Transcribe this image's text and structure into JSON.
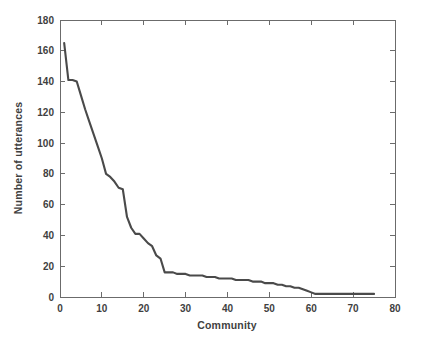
{
  "chart_data": {
    "type": "line",
    "title": "",
    "subtitle": "",
    "xlabel": "Community",
    "ylabel": "Number of utterances",
    "xlim": [
      0,
      80
    ],
    "ylim": [
      0,
      180
    ],
    "xticks": [
      0,
      10,
      20,
      30,
      40,
      50,
      60,
      70,
      80
    ],
    "yticks": [
      0,
      20,
      40,
      60,
      80,
      100,
      120,
      140,
      160,
      180
    ],
    "xtick_labels": [
      "0",
      "10",
      "20",
      "30",
      "40",
      "50",
      "60",
      "70",
      "80"
    ],
    "ytick_labels": [
      "0",
      "20",
      "40",
      "60",
      "80",
      "100",
      "120",
      "140",
      "160",
      "180"
    ],
    "grid": false,
    "legend": null,
    "legend_position": "none",
    "line_color": "#4a4a4a",
    "line_width": 2.1,
    "series": [
      {
        "name": "utterances-per-community",
        "x": [
          1,
          2,
          3,
          4,
          5,
          6,
          7,
          8,
          9,
          10,
          11,
          12,
          13,
          14,
          15,
          16,
          17,
          18,
          19,
          20,
          21,
          22,
          23,
          24,
          25,
          26,
          27,
          28,
          29,
          30,
          31,
          32,
          33,
          34,
          35,
          36,
          37,
          38,
          39,
          40,
          41,
          42,
          43,
          44,
          45,
          46,
          47,
          48,
          49,
          50,
          51,
          52,
          53,
          54,
          55,
          56,
          57,
          58,
          59,
          60,
          61,
          62,
          63,
          64,
          65,
          66,
          67,
          68,
          69,
          70,
          71,
          72,
          73,
          74,
          75
        ],
        "values": [
          165,
          141,
          141,
          140,
          131,
          122,
          114,
          106,
          98,
          90,
          80,
          78,
          75,
          71,
          70,
          52,
          45,
          41,
          41,
          38,
          35,
          33,
          27,
          25,
          16,
          16,
          16,
          15,
          15,
          15,
          14,
          14,
          14,
          14,
          13,
          13,
          13,
          12,
          12,
          12,
          12,
          11,
          11,
          11,
          11,
          10,
          10,
          10,
          9,
          9,
          9,
          8,
          8,
          7,
          7,
          6,
          6,
          5,
          4,
          3,
          2,
          2,
          2,
          2,
          2,
          2,
          2,
          2,
          2,
          2,
          2,
          2,
          2,
          2,
          2
        ]
      }
    ],
    "annotations": []
  },
  "axes": {
    "x_axis_name": "Community",
    "y_axis_name": "Number of utterances"
  }
}
